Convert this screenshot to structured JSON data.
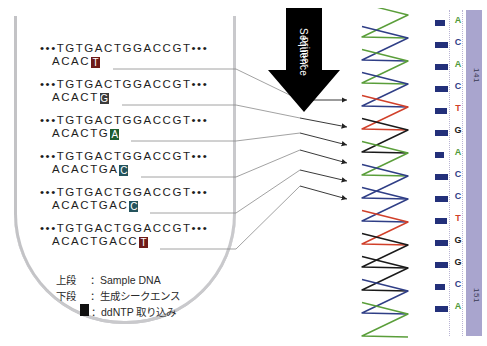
{
  "figure": {
    "tube_label": "reaction-tube"
  },
  "colors": {
    "adenine": "#1f5e2f",
    "cytosine": "#24535c",
    "guanine": "#3b3b3b",
    "thymine": "#6e1b18",
    "trace_green": "#5a9e3a",
    "trace_blue": "#2f3e86",
    "trace_red": "#d1402a",
    "trace_black": "#1a1a1a",
    "lavender_bar": "#a9a5ce",
    "tube_outline": "#c3c3c6",
    "peak_bar": "#23307a"
  },
  "reactions": [
    {
      "top": "•••TGTGACTGGACCGT•••",
      "bottom": "ACAC",
      "ddntp": "T",
      "ddntp_color": "#6e1b18"
    },
    {
      "top": "•••TGTGACTGGACCGT•••",
      "bottom": "ACACT",
      "ddntp": "G",
      "ddntp_color": "#3b3b3b"
    },
    {
      "top": "•••TGTGACTGGACCGT•••",
      "bottom": "ACACTG",
      "ddntp": "A",
      "ddntp_color": "#1f5e2f"
    },
    {
      "top": "•••TGTGACTGGACCGT•••",
      "bottom": "ACACTGA",
      "ddntp": "C",
      "ddntp_color": "#24535c"
    },
    {
      "top": "•••TGTGACTGGACCGT•••",
      "bottom": "ACACTGAC",
      "ddntp": "C",
      "ddntp_color": "#24535c"
    },
    {
      "top": "•••TGTGACTGGACCGT•••",
      "bottom": "ACACTGACC",
      "ddntp": "T",
      "ddntp_color": "#6e1b18"
    }
  ],
  "primer_arrow": {
    "label_line1": "Sequence",
    "label_line2": "primer"
  },
  "basecalls": {
    "bases": [
      "A",
      "C",
      "A",
      "C",
      "T",
      "G",
      "A",
      "C",
      "C",
      "T",
      "G",
      "G",
      "C",
      "A"
    ],
    "position_labels": [
      "141",
      "151"
    ]
  },
  "legend": {
    "row1_key": "上段",
    "row1_sep": "：",
    "row1_value": "Sample DNA",
    "row2_key": "下段",
    "row2_sep": "：",
    "row2_value": "生成シークエンス",
    "row3_key": "",
    "row3_sep": "：",
    "row3_value": "ddNTP 取り込み"
  },
  "chart_data": {
    "type": "line",
    "xlabel": "",
    "ylabel": "",
    "orientation": "vertical",
    "legend_position": "none",
    "grid": false,
    "series": [
      {
        "name": "A",
        "color": "#5a9e3a"
      },
      {
        "name": "C",
        "color": "#2f3e86"
      },
      {
        "name": "T",
        "color": "#d1402a"
      },
      {
        "name": "G",
        "color": "#1a1a1a"
      }
    ],
    "peak_order": [
      "A",
      "C",
      "A",
      "C",
      "T",
      "G",
      "A",
      "C",
      "C",
      "T",
      "G",
      "G",
      "C",
      "A"
    ],
    "peak_colors": [
      "#5a9e3a",
      "#2f3e86",
      "#5a9e3a",
      "#2f3e86",
      "#d1402a",
      "#1a1a1a",
      "#5a9e3a",
      "#2f3e86",
      "#2f3e86",
      "#d1402a",
      "#1a1a1a",
      "#1a1a1a",
      "#2f3e86",
      "#5a9e3a"
    ],
    "peak_y": [
      18,
      41,
      64,
      87,
      110,
      133,
      156,
      179,
      202,
      225,
      248,
      271,
      294,
      317
    ],
    "xlim": [
      0,
      1
    ],
    "ylim": [
      0,
      330
    ]
  }
}
